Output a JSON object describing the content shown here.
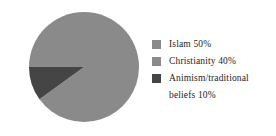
{
  "chart_data": {
    "type": "pie",
    "title": "",
    "categories": [
      "Islam",
      "Christianity",
      "Animism/traditional beliefs"
    ],
    "values": [
      50,
      40,
      10
    ],
    "value_unit": "%",
    "labels": [
      "Islam 50%",
      "Christianity 40%",
      "Animism/traditional beliefs 10%"
    ],
    "colors": [
      "#8a8a8a",
      "#8a8a8a",
      "#454545"
    ],
    "start_angle_deg": 180,
    "direction": "clockwise",
    "legend_position": "right",
    "grid": false,
    "background": "#ffffff"
  },
  "legend": {
    "entries": [
      {
        "label": "Islam 50%",
        "color": "#8a8a8a",
        "percent": 50
      },
      {
        "label": "Christianity 40%",
        "color": "#8a8a8a",
        "percent": 40
      },
      {
        "label": "Animism/traditional\nbeliefs 10%",
        "color": "#454545",
        "percent": 10
      }
    ]
  }
}
